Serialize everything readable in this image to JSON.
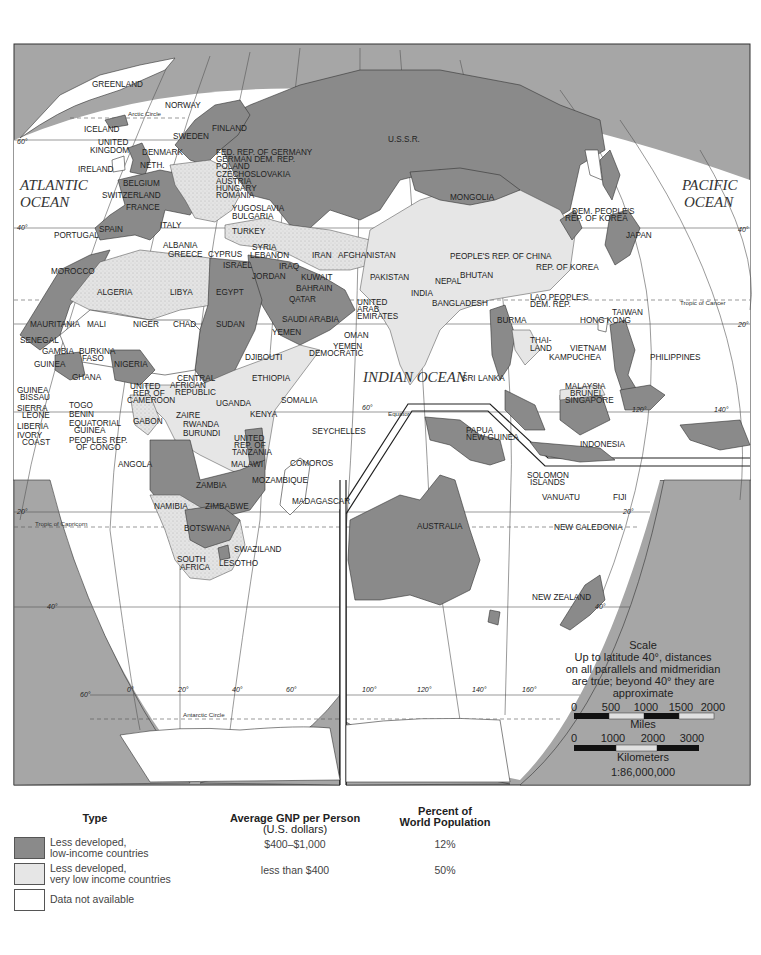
{
  "map": {
    "oceans": {
      "atlantic": [
        "ATLANTIC",
        "OCEAN"
      ],
      "pacific": [
        "PACIFIC",
        "OCEAN"
      ],
      "indian": "INDIAN OCEAN"
    },
    "lines": {
      "arctic_circle": "Arctic Circle",
      "tropic_cancer": "Tropic of Cancer",
      "equator": "Equator",
      "tropic_capricorn": "Tropic of Capricorn",
      "antarctic_circle": "Antarctic Circle"
    },
    "degree_labels": {
      "lat_60_n": "60°",
      "lat_40_n": "40°",
      "lat_40_n_right": "40°",
      "lat_20_n_right": "20°",
      "lat_20_s": "20°",
      "lat_40_s": "40°",
      "lat_60_s": "60°",
      "lat_20_s_right": "20°",
      "lat_40_s_right": "40°",
      "lon_0": "0°",
      "lon_20": "20°",
      "lon_40": "40°",
      "lon_60": "60°",
      "lon_60_b": "60°",
      "lon_100": "100°",
      "lon_120": "120°",
      "lon_140": "140°",
      "lon_160": "160°",
      "lon_120_b": "120°",
      "lon_140_b": "140°"
    },
    "countries": {
      "greenland": "GREENLAND",
      "iceland": "ICELAND",
      "norway": "NORWAY",
      "sweden": "SWEDEN",
      "finland": "FINLAND",
      "uk": [
        "UNITED",
        "KINGDOM"
      ],
      "ireland": "IRELAND",
      "denmark": "DENMARK",
      "neth": "NETH.",
      "belgium": "BELGIUM",
      "switzerland": "SWITZERLAND",
      "france": "FRANCE",
      "portugal": "PORTUGAL",
      "spain": "SPAIN",
      "italy": "ITALY",
      "frg": "FED. REP. OF GERMANY",
      "gdr": "GERMAN DEM. REP.",
      "poland": "POLAND",
      "czech": "CZECHOSLOVAKIA",
      "austria": "AUSTRIA",
      "hungary": "HUNGARY",
      "romania": "ROMANIA",
      "yugoslavia": "YUGOSLAVIA",
      "bulgaria": "BULGARIA",
      "albania": "ALBANIA",
      "greece": "GREECE",
      "cyprus": "CYPRUS",
      "turkey": "TURKEY",
      "syria": "SYRIA",
      "lebanon": "LEBANON",
      "israel": "ISRAEL",
      "jordan": "JORDAN",
      "iraq": "IRAQ",
      "iran": "IRAN",
      "kuwait": "KUWAIT",
      "bahrain": "BAHRAIN",
      "qatar": "QATAR",
      "saudi": "SAUDI ARABIA",
      "uae": [
        "UNITED",
        "ARAB",
        "EMIRATES"
      ],
      "oman": "OMAN",
      "yemen": "YEMEN",
      "yemen_dem": [
        "YEMEN",
        "DEMOCRATIC"
      ],
      "afghanistan": "AFGHANISTAN",
      "pakistan": "PAKISTAN",
      "india": "INDIA",
      "nepal": "NEPAL",
      "bhutan": "BHUTAN",
      "bangladesh": "BANGLADESH",
      "sri_lanka": "SRI LANKA",
      "burma": "BURMA",
      "thailand": [
        "THAI-",
        "LAND"
      ],
      "laos": [
        "LAO PEOPLE'S",
        "DEM. REP."
      ],
      "vietnam": "VIETNAM",
      "kampuchea": "KAMPUCHEA",
      "malaysia": "MALAYSIA",
      "brunei": "BRUNEI",
      "singapore": "SINGAPORE",
      "indonesia": "INDONESIA",
      "philippines": "PHILIPPINES",
      "hong_kong": "HONG KONG",
      "taiwan": "TAIWAN",
      "china": "PEOPLE'S REP. OF CHINA",
      "rok": "REP. OF KOREA",
      "dprk": [
        "DEM. PEOPLE'S",
        "REP. OF KOREA"
      ],
      "japan": "JAPAN",
      "mongolia": "MONGOLIA",
      "ussr": "U.S.S.R.",
      "morocco": "MOROCCO",
      "algeria": "ALGERIA",
      "libya": "LIBYA",
      "egypt": "EGYPT",
      "mauritania": "MAURITANIA",
      "mali": "MALI",
      "niger": "NIGER",
      "chad": "CHAD",
      "sudan": "SUDAN",
      "senegal": "SENEGAL",
      "gambia": "GAMBIA",
      "guinea": "GUINEA",
      "guinea_bissau": [
        "GUINEA",
        "BISSAU"
      ],
      "sierra_leone": [
        "SIERRA",
        "LEONE"
      ],
      "liberia": "LIBERIA",
      "ivory_coast": [
        "IVORY",
        "COAST"
      ],
      "burkina": [
        "BURKINA",
        "FASO"
      ],
      "ghana": "GHANA",
      "togo": "TOGO",
      "benin": "BENIN",
      "nigeria": "NIGERIA",
      "cameroon": [
        "UNITED",
        "REP. OF",
        "CAMEROON"
      ],
      "car": [
        "CENTRAL",
        "AFRICAN",
        "REPUBLIC"
      ],
      "eq_guinea": [
        "EQUATORIAL",
        "GUINEA"
      ],
      "gabon": "GABON",
      "congo": [
        "PEOPLES REP.",
        "OF CONGO"
      ],
      "zaire": "ZAIRE",
      "djibouti": "DJIBOUTI",
      "ethiopia": "ETHIOPIA",
      "somalia": "SOMALIA",
      "uganda": "UGANDA",
      "kenya": "KENYA",
      "rwanda": "RWANDA",
      "burundi": "BURUNDI",
      "tanzania": [
        "UNITED",
        "REP. OF",
        "TANZANIA"
      ],
      "seychelles": "SEYCHELLES",
      "comoros": "COMOROS",
      "angola": "ANGOLA",
      "malawi": "MALAWI",
      "zambia": "ZAMBIA",
      "mozambique": "MOZAMBIQUE",
      "madagascar": "MADAGASCAR",
      "namibia": "NAMIBIA",
      "zimbabwe": "ZIMBABWE",
      "botswana": "BOTSWANA",
      "swaziland": "SWAZILAND",
      "south_africa": [
        "SOUTH",
        "AFRICA"
      ],
      "lesotho": "LESOTHO",
      "png": [
        "PAPUA",
        "NEW GUINEA"
      ],
      "solomon": [
        "SOLOMON",
        "ISLANDS"
      ],
      "vanuatu": "VANUATU",
      "fiji": "FIJI",
      "new_caledonia": "NEW CALEDONIA",
      "australia": "AUSTRALIA",
      "new_zealand": "NEW ZEALAND"
    },
    "scale": {
      "title": "Scale",
      "note": [
        "Up to latitude 40°, distances",
        "on all parallels and midmeridian",
        "are true; beyond 40° they are",
        "approximate"
      ],
      "miles_ticks": [
        "0",
        "500",
        "1000",
        "1500",
        "2000"
      ],
      "miles_label": "Miles",
      "km_ticks": [
        "0",
        "1000",
        "2000",
        "3000"
      ],
      "km_label": "Kilometers",
      "ratio": "1:86,000,000"
    },
    "colors": {
      "low_income": "#8a8a8a",
      "very_low_income": "#e6e6e6",
      "no_data": "#ffffff",
      "frame_background": "#a6a6a6"
    }
  },
  "legend": {
    "headers": {
      "type": "Type",
      "gnp": "Average GNP per Person",
      "gnp_sub": "(U.S. dollars)",
      "pop_1": "Percent of",
      "pop_2": "World Population"
    },
    "rows": [
      {
        "line1": "Less developed,",
        "line2": "low-income countries",
        "gnp": "$400–$1,000",
        "pop": "12%",
        "swatch": "#8a8a8a"
      },
      {
        "line1": "Less developed,",
        "line2": "very low income countries",
        "gnp": "less than $400",
        "pop": "50%",
        "swatch": "#e6e6e6"
      },
      {
        "line1": "Data not available",
        "line2": "",
        "gnp": "",
        "pop": "",
        "swatch": "#ffffff"
      }
    ]
  }
}
